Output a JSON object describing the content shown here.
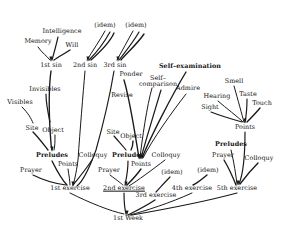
{
  "diagram": {
    "title_text": "1st Week",
    "type": "hand-drawn-tree-diagram",
    "line_color": "#1a1a1a",
    "background_color": "#ffffff",
    "root": {
      "label": "1st Week",
      "x": 128,
      "y": 218
    },
    "nodes": [
      {
        "id": "memory",
        "label": "Memory",
        "x": 38,
        "y": 41,
        "bold": false
      },
      {
        "id": "intelligence",
        "label": "Intelligence",
        "x": 62,
        "y": 31,
        "bold": false
      },
      {
        "id": "will",
        "label": "Will",
        "x": 72,
        "y": 45,
        "bold": false
      },
      {
        "id": "sin1",
        "label": "1st sin",
        "x": 51,
        "y": 65,
        "bold": false
      },
      {
        "id": "idem-a",
        "label": "(idem)",
        "x": 105,
        "y": 25,
        "bold": false
      },
      {
        "id": "sin2",
        "label": "2nd sin",
        "x": 85,
        "y": 65,
        "bold": false
      },
      {
        "id": "idem-b",
        "label": "(idem)",
        "x": 136,
        "y": 25,
        "bold": false
      },
      {
        "id": "sin3",
        "label": "3rd sin",
        "x": 115,
        "y": 65,
        "bold": false
      },
      {
        "id": "visibles",
        "label": "Visibles",
        "x": 20,
        "y": 102,
        "bold": false
      },
      {
        "id": "invisibles",
        "label": "Invisibles",
        "x": 45,
        "y": 89,
        "bold": false
      },
      {
        "id": "site-1",
        "label": "Site",
        "x": 32,
        "y": 128,
        "bold": false
      },
      {
        "id": "object-1",
        "label": "Object",
        "x": 53,
        "y": 130,
        "bold": false
      },
      {
        "id": "preludes-1",
        "label": "Preludes",
        "x": 52,
        "y": 155,
        "bold": true
      },
      {
        "id": "prayer-1",
        "label": "Prayer",
        "x": 31,
        "y": 170,
        "bold": false
      },
      {
        "id": "points-1",
        "label": "Points",
        "x": 68,
        "y": 164,
        "bold": false
      },
      {
        "id": "colloquy-1",
        "label": "Colloquy",
        "x": 93,
        "y": 155,
        "bold": false
      },
      {
        "id": "exercise-1",
        "label": "1st exercise",
        "x": 70,
        "y": 188,
        "bold": false
      },
      {
        "id": "ponder",
        "label": "Ponder",
        "x": 131,
        "y": 74,
        "bold": false
      },
      {
        "id": "self-comparison",
        "label": "Self–\ncomparison",
        "x": 158,
        "y": 81,
        "bold": false,
        "two_line": true
      },
      {
        "id": "self-examination",
        "label": "Self–examination",
        "x": 190,
        "y": 66,
        "bold": true
      },
      {
        "id": "revise",
        "label": "Revise",
        "x": 122,
        "y": 95,
        "bold": false
      },
      {
        "id": "admire",
        "label": "Admire",
        "x": 188,
        "y": 88,
        "bold": false
      },
      {
        "id": "site-2",
        "label": "Site",
        "x": 113,
        "y": 132,
        "bold": false
      },
      {
        "id": "object-2",
        "label": "Object",
        "x": 131,
        "y": 136,
        "bold": false
      },
      {
        "id": "preludes-2",
        "label": "Preludes",
        "x": 128,
        "y": 155,
        "bold": true
      },
      {
        "id": "prayer-2",
        "label": "Prayer",
        "x": 109,
        "y": 170,
        "bold": false
      },
      {
        "id": "points-2",
        "label": "Points",
        "x": 141,
        "y": 164,
        "bold": false
      },
      {
        "id": "colloquy-2",
        "label": "Colloquy",
        "x": 166,
        "y": 155,
        "bold": false
      },
      {
        "id": "exercise-2",
        "label": "2nd exercise",
        "x": 124,
        "y": 188,
        "bold": false,
        "underline": true
      },
      {
        "id": "idem-c",
        "label": "(idem)",
        "x": 172,
        "y": 172,
        "bold": false
      },
      {
        "id": "exercise-3",
        "label": "3rd exercise",
        "x": 156,
        "y": 195,
        "bold": false
      },
      {
        "id": "idem-d",
        "label": "(idem)",
        "x": 208,
        "y": 170,
        "bold": false
      },
      {
        "id": "exercise-4",
        "label": "4th exercise",
        "x": 192,
        "y": 188,
        "bold": false
      },
      {
        "id": "smell",
        "label": "Smell",
        "x": 234,
        "y": 81,
        "bold": false
      },
      {
        "id": "taste",
        "label": "Taste",
        "x": 248,
        "y": 94,
        "bold": false
      },
      {
        "id": "touch",
        "label": "Touch",
        "x": 262,
        "y": 103,
        "bold": false
      },
      {
        "id": "hearing",
        "label": "Hearing",
        "x": 217,
        "y": 96,
        "bold": false
      },
      {
        "id": "sight",
        "label": "Sight",
        "x": 210,
        "y": 107,
        "bold": false
      },
      {
        "id": "points-3",
        "label": "Points",
        "x": 245,
        "y": 127,
        "bold": false
      },
      {
        "id": "preludes-3",
        "label": "Preludes",
        "x": 231,
        "y": 144,
        "bold": true
      },
      {
        "id": "prayer-3",
        "label": "Prayer",
        "x": 223,
        "y": 155,
        "bold": false
      },
      {
        "id": "colloquy-3",
        "label": "Colloquy",
        "x": 259,
        "y": 158,
        "bold": false
      },
      {
        "id": "exercise-5",
        "label": "5th exercise",
        "x": 237,
        "y": 188,
        "bold": false
      }
    ],
    "branch_groups": [
      {
        "name": "first-sin-faculties",
        "parent": "sin1",
        "children": [
          "memory",
          "intelligence",
          "will"
        ]
      },
      {
        "name": "second-sin-faculties",
        "parent": "sin2",
        "children": [
          "idem-a"
        ]
      },
      {
        "name": "third-sin-faculties",
        "parent": "sin3",
        "children": [
          "idem-b"
        ]
      },
      {
        "name": "object-one-kinds",
        "parent": "object-1",
        "children": [
          "visibles",
          "invisibles"
        ]
      },
      {
        "name": "preludes-one-parts",
        "parent": "preludes-1",
        "children": [
          "site-1",
          "object-1"
        ]
      },
      {
        "name": "exercise-one-parts",
        "parent": "exercise-1",
        "children": [
          "prayer-1",
          "preludes-1",
          "points-1",
          "colloquy-1"
        ]
      },
      {
        "name": "points-two-acts",
        "parent": "points-2",
        "children": [
          "revise",
          "ponder",
          "self-comparison",
          "self-examination",
          "admire"
        ]
      },
      {
        "name": "preludes-two-parts",
        "parent": "preludes-2",
        "children": [
          "site-2",
          "object-2"
        ]
      },
      {
        "name": "exercise-two-parts",
        "parent": "exercise-2",
        "children": [
          "prayer-2",
          "preludes-2",
          "points-2",
          "colloquy-2"
        ]
      },
      {
        "name": "exercise-three-parts",
        "parent": "exercise-3",
        "children": [
          "idem-c"
        ]
      },
      {
        "name": "exercise-four-parts",
        "parent": "exercise-4",
        "children": [
          "idem-d"
        ]
      },
      {
        "name": "points-three-senses",
        "parent": "points-3",
        "children": [
          "sight",
          "hearing",
          "smell",
          "taste",
          "touch"
        ]
      },
      {
        "name": "exercise-five-parts",
        "parent": "exercise-5",
        "children": [
          "prayer-3",
          "preludes-3",
          "points-3",
          "colloquy-3"
        ]
      },
      {
        "name": "first-week-exercises",
        "parent": "root",
        "children": [
          "exercise-1",
          "exercise-2",
          "exercise-3",
          "exercise-4",
          "exercise-5"
        ]
      },
      {
        "name": "exercise-sin-links",
        "parent": "exercise-1",
        "children": [
          "sin1"
        ]
      },
      {
        "name": "exercise-two-sin-link",
        "parent": "exercise-2",
        "children": [
          "sin2",
          "sin3"
        ]
      }
    ],
    "paths": [
      "M 38 47 C 42 53 47 56 50 60",
      "M 58 37 C 56 46 54 53 52 60",
      "M 70 50 C 64 54 58 57 54 60",
      "M 105 31 C 100 40 92 52 87 60",
      "M 110 32 C 105 41 97 52 89 60",
      "M 114 33 C 110 42 100 52 91 60",
      "M 133 31 C 128 40 122 51 117 60",
      "M 139 32 C 134 41 126 51 119 60",
      "M 144 34 C 138 43 128 52 121 60",
      "M 22 107 C 28 113 31 118 33 123",
      "M 46 94 C 46 103 48 113 50 122",
      "M 33 132 C 39 138 44 145 48 150",
      "M 55 135 C 55 141 55 146 54 150",
      "M 33 175 C 45 181 58 184 66 185",
      "M 52 161 C 57 171 62 180 67 185",
      "M 68 169 C 69 176 70 181 70 185",
      "M 92 160 C 86 169 78 179 73 185",
      "M 51 71 C 49 85 49 110 50 130 C 51 142 51 148 52 150",
      "M 85 71 C 83 95 80 130 78 160 C 76 175 74 182 73 185",
      "M 114 71 C 110 95 103 125 96 150 C 88 172 82 182 77 186",
      "M 124 80 C 130 100 136 140 139 158",
      "M 152 88 C 147 105 142 140 140 158",
      "M 161 90 C 155 110 145 143 141 158",
      "M 186 72 C 172 95 150 138 142 158",
      "M 186 94 C 172 112 152 140 143 158",
      "M 114 136 C 119 142 124 147 126 150",
      "M 133 141 C 133 145 132 148 131 150",
      "M 110 175 C 118 181 122 184 123 185",
      "M 128 161 C 128 172 126 180 125 185",
      "M 141 169 C 136 176 130 182 127 185",
      "M 165 160 C 152 170 137 181 129 186",
      "M 170 177 C 164 183 159 189 156 192",
      "M 207 175 C 201 180 196 184 193 185",
      "M 234 86 C 238 100 242 115 244 122",
      "M 247 99 C 247 108 246 117 245 122",
      "M 260 108 C 255 114 250 119 247 122",
      "M 218 101 C 226 108 238 117 243 122",
      "M 211 112 C 221 116 235 120 242 122",
      "M 224 160 C 230 170 234 180 236 185",
      "M 231 150 C 234 162 236 176 237 184",
      "M 245 132 C 245 150 244 172 239 184",
      "M 258 163 C 250 171 243 180 240 184",
      "M 70 193 C 90 203 110 211 124 214",
      "M 124 193 C 124 203 125 210 126 214",
      "M 155 200 C 146 206 134 212 128 215",
      "M 192 193 C 170 203 145 211 130 215",
      "M 237 193 C 200 203 155 211 132 215"
    ]
  }
}
